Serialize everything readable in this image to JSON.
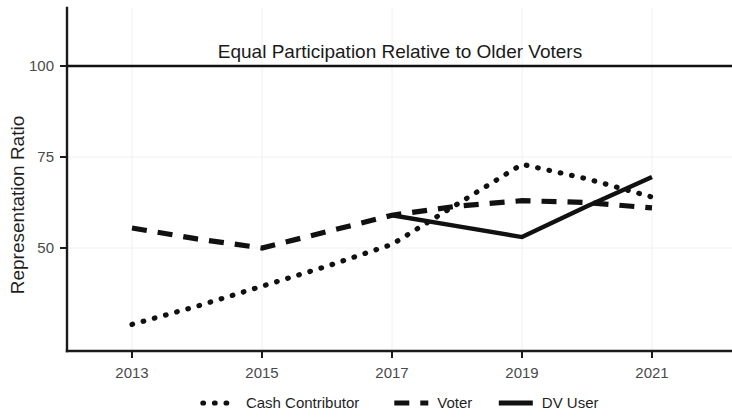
{
  "chart_data": {
    "type": "line",
    "title": "",
    "annotation": "Equal Participation Relative to Older Voters",
    "xlabel": "",
    "ylabel": "Representation Ratio",
    "xlim": [
      2012.0,
      2021.9
    ],
    "ylim": [
      27.0,
      103.0
    ],
    "x_ticks": [
      2013,
      2015,
      2017,
      2019,
      2021
    ],
    "x_tick_labels": [
      "2013",
      "2015",
      "2017",
      "2019",
      "2021"
    ],
    "y_ticks": [
      50,
      75,
      100
    ],
    "y_tick_labels": [
      "50",
      "75",
      "100"
    ],
    "grid": true,
    "legend_position": "bottom",
    "reference_line": {
      "value": 100,
      "label": "Equal Participation Relative to Older Voters"
    },
    "series": [
      {
        "name": "Cash Contributor",
        "style": "dotted",
        "color": "#111111",
        "x": [
          2013,
          2014,
          2015,
          2016,
          2017,
          2018,
          2019,
          2020,
          2021
        ],
        "values": [
          29.0,
          34.0,
          39.5,
          45.0,
          51.0,
          62.0,
          73.0,
          69.0,
          64.0
        ]
      },
      {
        "name": "Voter",
        "style": "dashed",
        "color": "#111111",
        "x": [
          2013,
          2014,
          2015,
          2016,
          2017,
          2018,
          2019,
          2020,
          2021
        ],
        "values": [
          55.5,
          52.5,
          50.0,
          54.5,
          59.0,
          61.5,
          63.0,
          62.5,
          61.0
        ]
      },
      {
        "name": "DV User",
        "style": "solid",
        "color": "#111111",
        "x": [
          2017,
          2018,
          2019,
          2020,
          2021
        ],
        "values": [
          59.0,
          56.0,
          53.0,
          61.5,
          69.5
        ]
      }
    ]
  },
  "legend": {
    "items": [
      {
        "label": "Cash Contributor",
        "style": "dotted"
      },
      {
        "label": "Voter",
        "style": "dashed"
      },
      {
        "label": "DV User",
        "style": "solid"
      }
    ]
  },
  "axes": {
    "y_title": "Representation Ratio"
  }
}
